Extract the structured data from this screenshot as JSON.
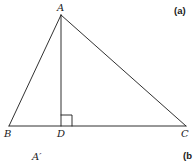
{
  "figure": {
    "panel_a_label": "(a)",
    "panel_b_label": "(b",
    "stroke_color": "#1a1a1a",
    "background": "#ffffff"
  },
  "vertices": {
    "A": {
      "label": "A",
      "x": 61,
      "y": 15
    },
    "B": {
      "label": "B",
      "x": 9,
      "y": 126
    },
    "C": {
      "label": "C",
      "x": 186,
      "y": 126
    },
    "D": {
      "label": "D",
      "x": 61,
      "y": 126
    }
  },
  "segments": [
    "AB",
    "AC",
    "BC",
    "AD"
  ],
  "right_angle": {
    "at": "D",
    "size": 11
  },
  "extra_labels": {
    "a_prime": "A′"
  }
}
